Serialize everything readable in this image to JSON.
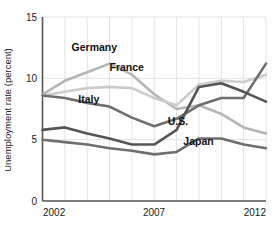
{
  "chart_data": {
    "type": "line",
    "title": "",
    "xlabel": "",
    "ylabel": "Unemployment rate (percent)",
    "xlim": [
      2002,
      2012
    ],
    "ylim": [
      0,
      15
    ],
    "yticks": [
      0,
      5,
      10,
      15
    ],
    "ytick_labels": [
      "0",
      "5",
      "10",
      "15"
    ],
    "xticks": [
      2002,
      2007,
      2012
    ],
    "xtick_labels": [
      "2002",
      "2007",
      "2012"
    ],
    "gridlines": "vertical-每-year-and-horizontal-at-yticks",
    "grid": true,
    "legend_position": "inline-labels",
    "x": [
      2002,
      2003,
      2004,
      2005,
      2006,
      2007,
      2008,
      2009,
      2010,
      2011,
      2012
    ],
    "series": [
      {
        "name": "Germany",
        "color": "#b5b5b5",
        "label_x": 2003.3,
        "label_y": 12.2,
        "values": [
          8.7,
          9.8,
          10.5,
          11.2,
          10.3,
          8.7,
          7.5,
          7.8,
          7.1,
          6.0,
          5.5
        ]
      },
      {
        "name": "France",
        "color": "#cccccc",
        "label_x": 2005.0,
        "label_y": 10.6,
        "values": [
          8.6,
          8.9,
          9.2,
          9.3,
          9.2,
          8.4,
          7.8,
          9.5,
          9.8,
          9.7,
          10.3
        ]
      },
      {
        "name": "Italy",
        "color": "#6e6e6e",
        "label_x": 2003.6,
        "label_y": 8.0,
        "values": [
          8.6,
          8.4,
          8.0,
          7.7,
          6.8,
          6.1,
          6.7,
          7.8,
          8.4,
          8.4,
          11.2
        ]
      },
      {
        "name": "U.S.",
        "color": "#555555",
        "label_x": 2007.6,
        "label_y": 6.2,
        "values": [
          5.8,
          6.0,
          5.5,
          5.1,
          4.6,
          4.6,
          5.8,
          9.3,
          9.6,
          8.9,
          8.1
        ]
      },
      {
        "name": "Japan",
        "color": "#6e6e6e",
        "label_x": 2008.3,
        "label_y": 4.6,
        "values": [
          5.0,
          4.8,
          4.6,
          4.3,
          4.1,
          3.8,
          4.0,
          5.1,
          5.1,
          4.6,
          4.3
        ]
      }
    ]
  },
  "axis": {
    "y_title": "Unemployment rate (percent)",
    "y_tick_0": "0",
    "y_tick_1": "5",
    "y_tick_2": "10",
    "y_tick_3": "15",
    "x_tick_0": "2002",
    "x_tick_1": "2007",
    "x_tick_2": "2012"
  },
  "labels": {
    "germany": "Germany",
    "france": "France",
    "italy": "Italy",
    "us": "U.S.",
    "japan": "Japan"
  },
  "colors": {
    "germany": "#b5b5b5",
    "france": "#cccccc",
    "italy": "#6e6e6e",
    "us": "#555555",
    "japan": "#6e6e6e",
    "axis": "#555555",
    "grid": "#e2e2e2",
    "background": "#ffffff"
  }
}
